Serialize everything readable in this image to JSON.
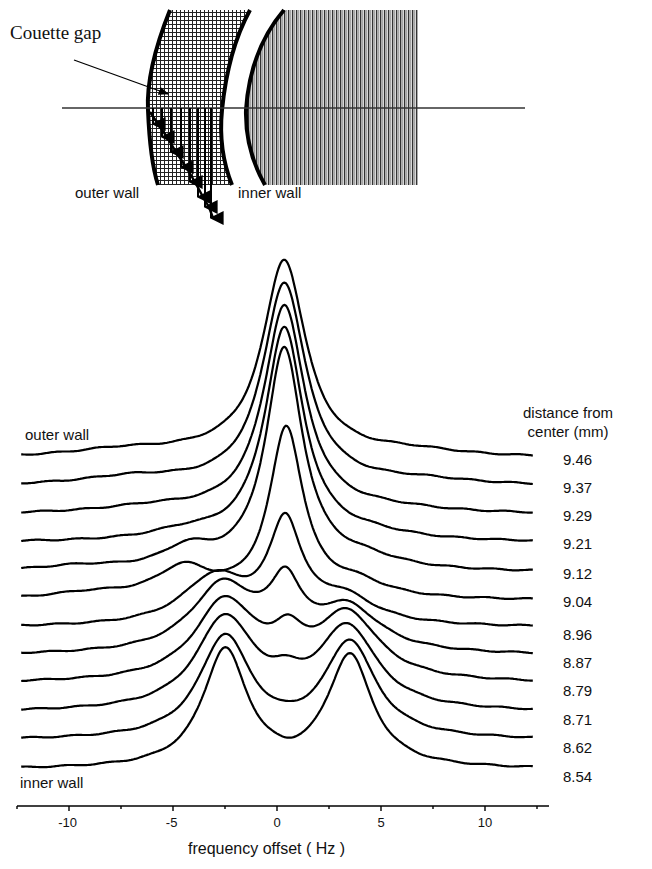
{
  "diagram": {
    "title_label": "Couette gap",
    "outer_wall_label": "outer wall",
    "inner_wall_label": "inner wall",
    "velocity_arrows": 6
  },
  "spectra_labels": {
    "top_trace_label": "outer wall",
    "bottom_trace_label": "inner wall",
    "distance_header_line1": "distance from",
    "distance_header_line2": "center (mm)"
  },
  "chart_data": {
    "type": "line",
    "title": "",
    "xlabel": "frequency offset ( Hz )",
    "ylabel": "",
    "xlim": [
      -12.5,
      12.5
    ],
    "xticks": [
      -10,
      -5,
      0,
      5,
      10
    ],
    "xtick_labels": [
      "-10",
      "-5",
      "0",
      "5",
      "10"
    ],
    "minor_xticks": [
      -12.5,
      -7.5,
      -2.5,
      2.5,
      7.5,
      12.5
    ],
    "grid": false,
    "legend": "right-side labels (distance from center, mm)",
    "series_model": "baseline offset + sum of Lorentzian peaks [center_Hz, amplitude_px, width_Hz]",
    "series": [
      {
        "name": "9.46",
        "baseline": 459,
        "peaks": [
          [
            0.35,
            196,
            1.25
          ],
          [
            -7.5,
            7,
            3
          ],
          [
            6.5,
            6,
            3
          ],
          [
            -3,
            4,
            3
          ]
        ]
      },
      {
        "name": "9.37",
        "baseline": 487,
        "peaks": [
          [
            0.35,
            203,
            1.25
          ],
          [
            -7,
            8,
            3
          ],
          [
            7,
            5,
            3
          ]
        ]
      },
      {
        "name": "9.29",
        "baseline": 515,
        "peaks": [
          [
            0.35,
            208,
            1.2
          ],
          [
            -6,
            6,
            3
          ],
          [
            5.5,
            4,
            3
          ]
        ]
      },
      {
        "name": "9.21",
        "baseline": 543,
        "peaks": [
          [
            0.35,
            213,
            1.15
          ],
          [
            -4.5,
            8,
            2
          ],
          [
            4.5,
            6,
            2.5
          ]
        ]
      },
      {
        "name": "9.12",
        "baseline": 573,
        "peaks": [
          [
            0.35,
            221,
            1.1
          ],
          [
            -4.3,
            20,
            1.5
          ],
          [
            4.2,
            10,
            2.2
          ],
          [
            -9.5,
            5,
            2.5
          ]
        ]
      },
      {
        "name": "9.04",
        "baseline": 601,
        "peaks": [
          [
            0.45,
            169,
            1.0
          ],
          [
            -4.5,
            30,
            1.6
          ],
          [
            3.8,
            14,
            1.8
          ],
          [
            -9,
            6,
            2.5
          ]
        ]
      },
      {
        "name": "8.96",
        "baseline": 628,
        "peaks": [
          [
            0.4,
            96,
            0.95
          ],
          [
            -3,
            48,
            1.9
          ],
          [
            3.2,
            26,
            1.9
          ]
        ]
      },
      {
        "name": "8.87",
        "baseline": 656,
        "peaks": [
          [
            0.4,
            58,
            0.9
          ],
          [
            -2.6,
            68,
            1.9
          ],
          [
            3.4,
            44,
            1.9
          ]
        ]
      },
      {
        "name": "8.79",
        "baseline": 684,
        "peaks": [
          [
            0.5,
            30,
            0.9
          ],
          [
            -2.5,
            80,
            1.8
          ],
          [
            3.4,
            66,
            1.8
          ]
        ]
      },
      {
        "name": "8.71",
        "baseline": 713,
        "peaks": [
          [
            0.4,
            14,
            0.9
          ],
          [
            -2.5,
            92,
            1.7
          ],
          [
            3.4,
            82,
            1.7
          ]
        ]
      },
      {
        "name": "8.62",
        "baseline": 741,
        "peaks": [
          [
            -2.5,
            102,
            1.5
          ],
          [
            3.5,
            96,
            1.5
          ]
        ]
      },
      {
        "name": "8.54",
        "baseline": 770,
        "peaks": [
          [
            -2.5,
            118,
            1.3
          ],
          [
            3.5,
            112,
            1.3
          ],
          [
            0.5,
            -4,
            0.8
          ]
        ]
      }
    ]
  }
}
